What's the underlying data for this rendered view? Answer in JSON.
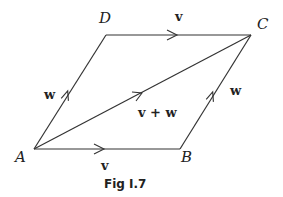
{
  "figure": {
    "caption": "Fig I.7",
    "points": {
      "A": {
        "label": "A"
      },
      "B": {
        "label": "B"
      },
      "C": {
        "label": "C"
      },
      "D": {
        "label": "D"
      }
    },
    "vectors": {
      "AB": {
        "label": "v"
      },
      "DC": {
        "label": "v"
      },
      "AD": {
        "label": "w"
      },
      "BC": {
        "label": "w"
      },
      "AC": {
        "label": "v + w"
      }
    }
  }
}
